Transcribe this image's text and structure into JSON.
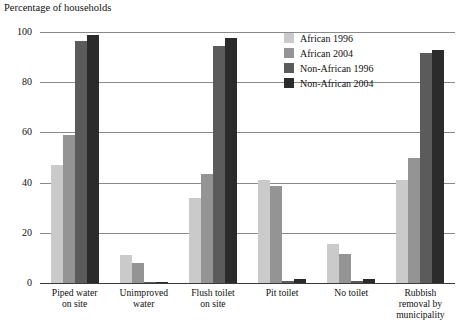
{
  "chart_data": {
    "type": "bar",
    "title": "",
    "subtitle": "",
    "xlabel": "",
    "ylabel": "Percentage of households",
    "ylim": [
      0,
      100
    ],
    "yticks": [
      0,
      20,
      40,
      60,
      80,
      100
    ],
    "ytick_labels": [
      "0",
      "20",
      "40",
      "60",
      "80",
      "100"
    ],
    "grid": true,
    "legend_position": "top-right",
    "categories": [
      "Piped water on site",
      "Unimproved water",
      "Flush toilet on site",
      "Pit toilet",
      "No toilet",
      "Rubbish removal by municipality"
    ],
    "category_lines": [
      [
        "Piped water",
        "on site"
      ],
      [
        "Unimproved",
        "water"
      ],
      [
        "Flush toilet",
        "on site"
      ],
      [
        "Pit toilet"
      ],
      [
        "No toilet"
      ],
      [
        "Rubbish",
        "removal by",
        "municipality"
      ]
    ],
    "series": [
      {
        "name": "African 1996",
        "color": "#cacaca",
        "values": [
          47,
          11,
          34,
          41,
          15.5,
          41
        ]
      },
      {
        "name": "African 2004",
        "color": "#949494",
        "values": [
          59,
          8,
          43.5,
          38.5,
          11.5,
          50
        ]
      },
      {
        "name": "Non-African 1996",
        "color": "#5b5b5b",
        "values": [
          96.5,
          0.5,
          94.5,
          1,
          1,
          91.5
        ]
      },
      {
        "name": "Non-African 2004",
        "color": "#2b2b2b",
        "values": [
          99,
          0.5,
          97.5,
          1.5,
          1.5,
          93
        ]
      }
    ]
  },
  "legend": {
    "items": [
      {
        "label": "African 1996",
        "color": "#cacaca"
      },
      {
        "label": "African 2004",
        "color": "#949494"
      },
      {
        "label": "Non-African 1996",
        "color": "#5b5b5b"
      },
      {
        "label": "Non-African 2004",
        "color": "#2b2b2b"
      }
    ]
  },
  "axis": {
    "y_title": "Percentage of households"
  }
}
